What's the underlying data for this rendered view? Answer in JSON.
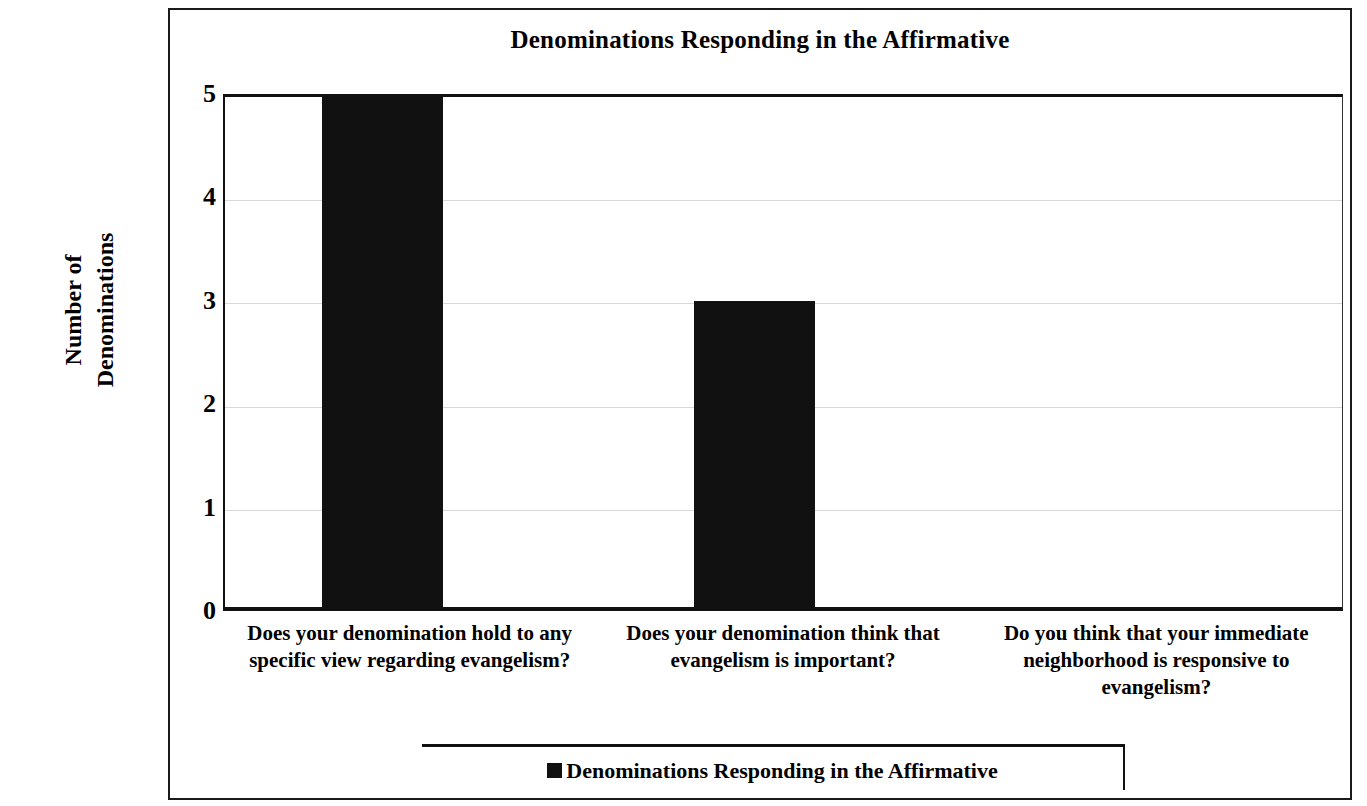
{
  "chart_data": {
    "type": "bar",
    "title": "Denominations Responding in the Affirmative",
    "xlabel": "",
    "ylabel": "Number of Denominations",
    "ylabel_lines": [
      "Number of",
      "Denominations"
    ],
    "categories": [
      "Does your denomination hold to any specific view regarding evangelism?",
      "Does your denomination think that evangelism is important?",
      "Do you think that your immediate neighborhood is responsive to evangelism?"
    ],
    "values": [
      5,
      3,
      0
    ],
    "series": [
      {
        "name": "Denominations Responding in the Affirmative",
        "values": [
          5,
          3,
          0
        ],
        "color": "#111111"
      }
    ],
    "ylim": [
      0,
      5
    ],
    "yticks": [
      0,
      1,
      2,
      3,
      4,
      5
    ],
    "ytick_labels": [
      "0",
      "1",
      "2",
      "3",
      "4",
      "5"
    ],
    "grid": true,
    "grid_axis": "y",
    "legend": {
      "position": "bottom",
      "entries": [
        {
          "label": "Denominations Responding in the Affirmative",
          "marker": "filled-square",
          "color": "#111111"
        }
      ]
    },
    "bar_color": "#111111",
    "background_color": "#ffffff"
  }
}
